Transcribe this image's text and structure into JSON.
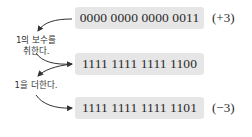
{
  "rows": [
    {
      "bits": "0000 0000 0000 0011",
      "label": "(+3)"
    },
    {
      "bits": "1111 1111 1111 1100",
      "label": ""
    },
    {
      "bits": "1111 1111 1111 1101",
      "label": "(−3)"
    }
  ],
  "steps": [
    {
      "line1": "1의 보수를",
      "line2": "취한다."
    },
    {
      "line1": "1을 더한다."
    }
  ],
  "colors": {
    "box_fill": "#e6e6e6",
    "arrow": "#333333"
  }
}
